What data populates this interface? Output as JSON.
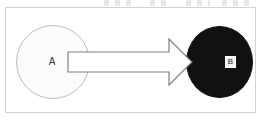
{
  "figure": {
    "title": "",
    "caption": "",
    "background_color": "#ffffff",
    "frame": {
      "name": "figure-border",
      "stroke_color": "#d2d2d2"
    },
    "nodes": [
      {
        "id": "A",
        "label": "A",
        "shape": "circle",
        "fill_color": "#fbfbfb",
        "stroke_color": "#bdbdbd",
        "label_color": "#3a3a3a"
      },
      {
        "id": "B",
        "label": "B",
        "shape": "circle",
        "fill_color": "#111111",
        "stroke_color": "#111111",
        "label_color": "#1b1b1b",
        "label_box_color": "#f2f2f2"
      }
    ],
    "edges": [
      {
        "id": "A-to-B",
        "from": "A",
        "to": "B",
        "style": "block-arrow",
        "direction": "right",
        "label": "",
        "fill_color": "#ffffff",
        "stroke_color": "#808080"
      }
    ],
    "artifacts": {
      "top_scan_marks": "illegible cropped text fragments"
    }
  }
}
